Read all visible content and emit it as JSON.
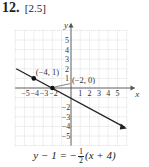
{
  "problem": {
    "number": "12.",
    "reference": "[2.5]"
  },
  "graph": {
    "x_axis_label": "x",
    "y_axis_label": "y",
    "x_tick_labels_negative": [
      "−5",
      "−4",
      "−3",
      "−2"
    ],
    "x_tick_labels_positive": [
      "1",
      "2",
      "3",
      "4",
      "5"
    ],
    "y_tick_labels_positive": [
      "5",
      "4",
      "3",
      "2",
      "1"
    ],
    "y_tick_labels_negative": [
      "−2",
      "−3",
      "−4",
      "−5"
    ],
    "points": [
      {
        "label": "(−4, 1)",
        "x": -4,
        "y": 1
      },
      {
        "label": "(−2, 0)",
        "x": -2,
        "y": 0
      }
    ],
    "line_color": "#222222",
    "grid_color": "#c8c8c8"
  },
  "equation": {
    "lhs": "y − 1 = −",
    "frac_num": "1",
    "frac_den": "2",
    "rhs": "(x + 4)"
  },
  "chart_data": {
    "type": "line",
    "title": "",
    "xlabel": "x",
    "ylabel": "y",
    "xlim": [
      -6,
      6
    ],
    "ylim": [
      -6,
      6
    ],
    "grid": true,
    "series": [
      {
        "name": "y − 1 = −1/2(x + 4)",
        "x": [
          -6,
          6
        ],
        "y": [
          2,
          -4
        ]
      }
    ],
    "points": [
      {
        "label": "(−4, 1)",
        "x": -4,
        "y": 1
      },
      {
        "label": "(−2, 0)",
        "x": -2,
        "y": 0
      }
    ],
    "annotations": [
      "(−4, 1)",
      "(−2, 0)"
    ]
  }
}
